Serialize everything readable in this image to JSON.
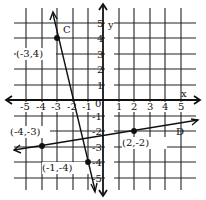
{
  "graph": {
    "x_axis_label": "x",
    "y_axis_label": "y",
    "origin_label": "0",
    "x_ticks": [
      "-5",
      "-4",
      "-3",
      "-2",
      "-1",
      "1",
      "2",
      "3",
      "4",
      "5"
    ],
    "y_ticks": [
      "5",
      "4",
      "3",
      "2",
      "1",
      "-1",
      "-2",
      "-3",
      "-4",
      "-5"
    ],
    "range": {
      "xmin": -5,
      "xmax": 5,
      "ymin": -5,
      "ymax": 5
    },
    "lines": [
      {
        "name": "C",
        "points": [
          [
            -3,
            4
          ],
          [
            -1,
            -4
          ]
        ]
      },
      {
        "name": "D",
        "points": [
          [
            -4,
            -3
          ],
          [
            2,
            -2
          ]
        ]
      }
    ],
    "point_labels": {
      "p1": "(-3,4)",
      "p2": "(-4,-3)",
      "p3": "(-1,-4)",
      "p4": "(2,-2)"
    },
    "line_labels": {
      "C": "C",
      "D": "D"
    },
    "colors": {
      "ink": "#111111",
      "background": "#ffffff"
    }
  }
}
